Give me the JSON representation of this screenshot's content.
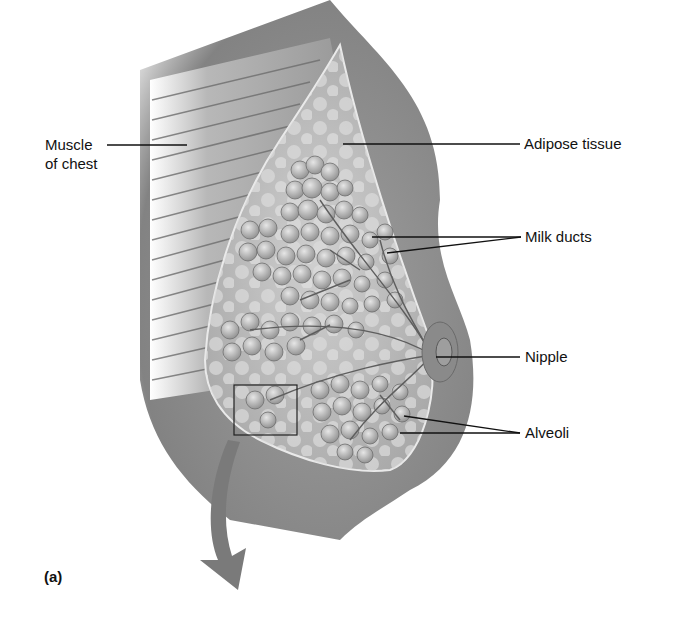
{
  "figure": {
    "panel_label": "(a)",
    "labels": {
      "muscle_line1": "Muscle",
      "muscle_line2": "of chest",
      "adipose": "Adipose tissue",
      "milk_ducts": "Milk ducts",
      "nipple": "Nipple",
      "alveoli": "Alveoli"
    },
    "colors": {
      "skin": "#8c8c8c",
      "tissue": "#bdbdbd",
      "lobule": "#a8a8a8",
      "arrow": "#7a7a7a",
      "line": "#111111"
    }
  }
}
